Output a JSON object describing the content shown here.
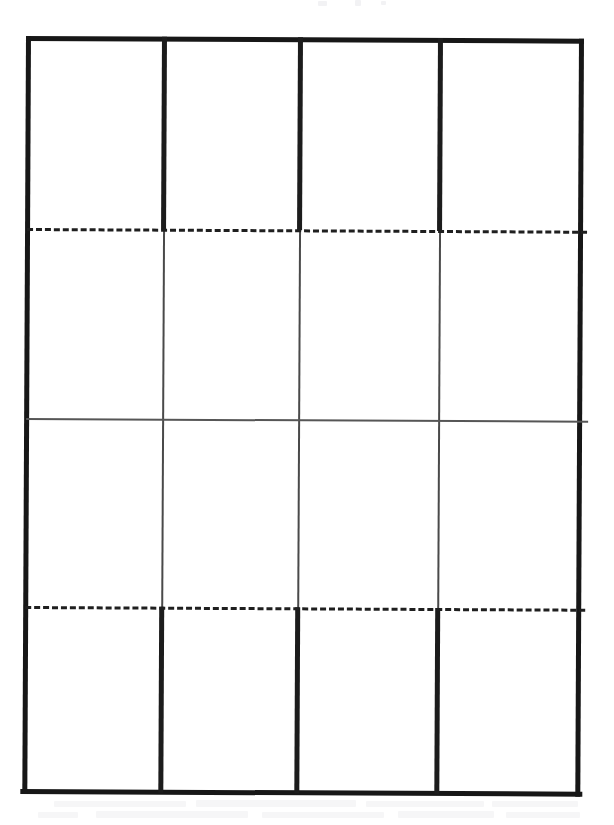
{
  "document": {
    "kind": "scanned-paper-form",
    "title": "Blank four-column grid form",
    "page_background": "#ffffff",
    "ink_color": "#171717",
    "thin_ink_color": "#565656",
    "skew_degrees": 0.28
  },
  "grid": {
    "column_count": 4,
    "band_count": 4,
    "columns": [
      {
        "id": "col-1",
        "label": ""
      },
      {
        "id": "col-2",
        "label": ""
      },
      {
        "id": "col-3",
        "label": ""
      },
      {
        "id": "col-4",
        "label": ""
      }
    ],
    "bands": [
      {
        "id": "band-1",
        "label": "",
        "divider_weight": "thick"
      },
      {
        "id": "band-2",
        "label": "",
        "divider_weight": "thin"
      },
      {
        "id": "band-3",
        "label": "",
        "divider_weight": "thin"
      },
      {
        "id": "band-4",
        "label": "",
        "divider_weight": "thick"
      }
    ],
    "cells": [
      [
        "",
        "",
        "",
        ""
      ],
      [
        "",
        "",
        "",
        ""
      ],
      [
        "",
        "",
        "",
        ""
      ],
      [
        "",
        "",
        "",
        ""
      ]
    ]
  },
  "rules": {
    "outer_frame": {
      "style": "solid",
      "weight": "thick",
      "color": "#171717"
    },
    "horizontal": [
      {
        "id": "dashed-rule-upper",
        "style": "dashed",
        "weight": "medium",
        "color": "#1f1f1f"
      },
      {
        "id": "mid-rule",
        "style": "solid",
        "weight": "thin",
        "color": "#565656"
      },
      {
        "id": "dashed-rule-lower",
        "style": "dashed",
        "weight": "medium",
        "color": "#1f1f1f"
      }
    ]
  },
  "artifacts": {
    "top_marks": [
      {
        "x": 318,
        "y": 1,
        "w": 9,
        "h": 5
      },
      {
        "x": 355,
        "y": 0,
        "w": 6,
        "h": 6
      },
      {
        "x": 381,
        "y": 1,
        "w": 5,
        "h": 4
      }
    ],
    "bottom_lines": [
      {
        "x": 54,
        "y": 3,
        "w": 132,
        "h": 6
      },
      {
        "x": 196,
        "y": 2,
        "w": 160,
        "h": 7
      },
      {
        "x": 366,
        "y": 3,
        "w": 118,
        "h": 6
      },
      {
        "x": 492,
        "y": 3,
        "w": 86,
        "h": 6
      },
      {
        "x": 38,
        "y": 14,
        "w": 40,
        "h": 6
      },
      {
        "x": 96,
        "y": 13,
        "w": 152,
        "h": 7
      },
      {
        "x": 262,
        "y": 14,
        "w": 122,
        "h": 6
      },
      {
        "x": 398,
        "y": 13,
        "w": 96,
        "h": 7
      },
      {
        "x": 506,
        "y": 14,
        "w": 74,
        "h": 6
      }
    ]
  }
}
